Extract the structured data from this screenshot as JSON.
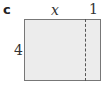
{
  "part_label": "c",
  "dimensions": {
    "top_left": "x",
    "top_right": "1",
    "left": "4"
  },
  "shapes": {
    "rectangle": {
      "fill": "#ececec",
      "stroke": "#777777"
    },
    "divider": {
      "style": "dashed",
      "stroke": "#555555"
    }
  }
}
